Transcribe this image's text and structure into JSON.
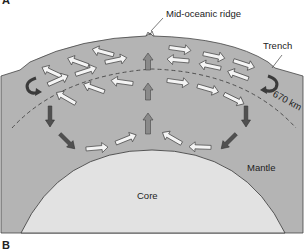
{
  "figure": {
    "panel_labels": [
      "A",
      "B"
    ],
    "labels": {
      "ridge": "Mid-oceanic ridge",
      "trench": "Trench",
      "depth": "670 km",
      "mantle": "Mantle",
      "core": "Core"
    },
    "colors": {
      "mantle": "#b4b4b4",
      "core": "#e2e2e2",
      "outline": "#333333",
      "upwelling_arrow": "#8a8a8a",
      "downwelling_arrow": "#505050",
      "flow_arrow_fill": "#f4f4f4"
    }
  }
}
